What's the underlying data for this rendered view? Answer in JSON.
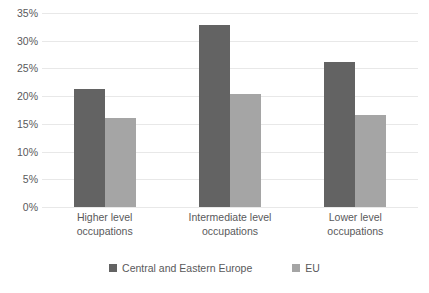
{
  "chart_data": {
    "type": "bar",
    "title": "",
    "subtitle": "",
    "xlabel": "",
    "ylabel": "",
    "categories": [
      "Higher level occupations",
      "Intermediate level occupations",
      "Lower level occupations"
    ],
    "category_lines": [
      [
        "Higher level",
        "occupations"
      ],
      [
        "Intermediate level",
        "occupations"
      ],
      [
        "Lower level",
        "occupations"
      ]
    ],
    "series": [
      {
        "name": "Central and Eastern Europe",
        "color": "#636363",
        "values": [
          21.3,
          32.8,
          26.2
        ]
      },
      {
        "name": "EU",
        "color": "#a5a5a5",
        "values": [
          16.1,
          20.4,
          16.6
        ]
      }
    ],
    "ylim": [
      0,
      35
    ],
    "ytick_step": 5,
    "ytick_labels": [
      "0%",
      "5%",
      "10%",
      "15%",
      "20%",
      "25%",
      "30%",
      "35%"
    ],
    "ytick_values": [
      0,
      5,
      10,
      15,
      20,
      25,
      30,
      35
    ],
    "grid": true,
    "grid_color": "#e8e8e8",
    "legend_position": "bottom",
    "value_suffix": "%"
  }
}
